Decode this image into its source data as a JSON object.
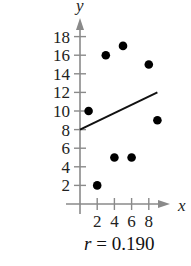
{
  "chart_data": {
    "type": "scatter",
    "title": "",
    "xlabel": "x",
    "ylabel": "y",
    "xlim": [
      0,
      9.5
    ],
    "ylim": [
      0,
      19
    ],
    "grid": false,
    "x_ticks": [
      2,
      4,
      6,
      8
    ],
    "y_ticks": [
      2,
      4,
      6,
      8,
      10,
      12,
      14,
      16,
      18
    ],
    "points": [
      {
        "x": 1,
        "y": 10
      },
      {
        "x": 2,
        "y": 2
      },
      {
        "x": 3,
        "y": 16
      },
      {
        "x": 4,
        "y": 5
      },
      {
        "x": 5,
        "y": 17
      },
      {
        "x": 6,
        "y": 5
      },
      {
        "x": 8,
        "y": 15
      },
      {
        "x": 9,
        "y": 9
      }
    ],
    "regression_line": {
      "x1": 0,
      "y1": 8,
      "x2": 9,
      "y2": 12
    },
    "annotation": {
      "variable": "r",
      "equals": " = ",
      "value": "0.190"
    }
  },
  "colors": {
    "axis": "#8a8a8a",
    "points": "#000000",
    "line": "#111111"
  }
}
